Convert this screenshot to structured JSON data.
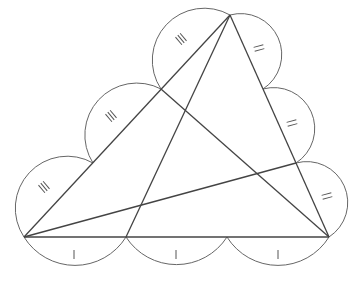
{
  "diagram": {
    "vertices": {
      "A": [
        230,
        15
      ],
      "B": [
        24,
        237
      ],
      "C": [
        329,
        237
      ]
    },
    "trisection_points": {
      "AB": [
        [
          161,
          89
        ],
        [
          93,
          163
        ]
      ],
      "AC": [
        [
          263,
          89
        ],
        [
          296,
          163
        ]
      ],
      "BC": [
        [
          126,
          237
        ],
        [
          227,
          237
        ]
      ]
    },
    "cevians": [
      {
        "from": [
          161,
          89
        ],
        "to": [
          329,
          237
        ]
      },
      {
        "from": [
          230,
          15
        ],
        "to": [
          126,
          237
        ]
      },
      {
        "from": [
          24,
          237
        ],
        "to": [
          296,
          163
        ]
      }
    ],
    "tick_marks": {
      "AB": 3,
      "AC": 2,
      "BC": 1
    },
    "colors": {
      "line": "#444444",
      "arc": "#666666"
    }
  }
}
